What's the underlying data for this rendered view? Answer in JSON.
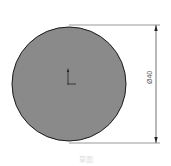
{
  "drawing": {
    "shape": "circle",
    "fill_color": "#8a8a8a",
    "stroke_color": "#1a1a1a",
    "dimension": {
      "label": "Ø40",
      "orientation": "vertical"
    },
    "origin_marker": "coordinate-axes-icon",
    "caption": "草图"
  }
}
